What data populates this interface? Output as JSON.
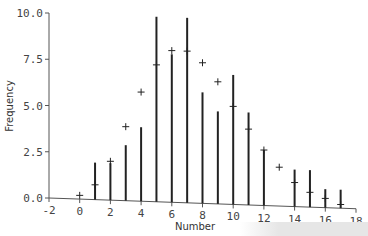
{
  "chart_data": {
    "type": "bar",
    "title": "",
    "xlabel": "Number",
    "ylabel": "Frequency",
    "xlim": [
      -2,
      18
    ],
    "ylim": [
      0,
      10
    ],
    "xticks": [
      -2,
      0,
      2,
      4,
      6,
      8,
      10,
      12,
      14,
      16,
      18
    ],
    "xtick_labels": [
      "-2",
      "0",
      "2",
      "4",
      "6",
      "8",
      "10",
      "12",
      "14",
      "16",
      "18"
    ],
    "yticks": [
      0,
      2.5,
      5,
      7.5,
      10
    ],
    "ytick_labels": [
      "0.0",
      "2.5",
      "5.0",
      "7.5",
      "10.0"
    ],
    "grid": false,
    "legend": null,
    "series": [
      {
        "name": "Observed frequency",
        "style": "vertical-lines",
        "x": [
          1,
          2,
          3,
          4,
          5,
          6,
          7,
          8,
          9,
          10,
          11,
          12,
          14,
          15,
          16,
          17
        ],
        "values": [
          2,
          2,
          3,
          4,
          10,
          8,
          10,
          6,
          5,
          7,
          5,
          3,
          2,
          2,
          1,
          1
        ]
      },
      {
        "name": "Expected frequency",
        "style": "plus-markers",
        "x": [
          0,
          1,
          2,
          3,
          4,
          5,
          6,
          7,
          8,
          9,
          10,
          11,
          12,
          13,
          14,
          15,
          16,
          17
        ],
        "values": [
          0.2,
          0.8,
          2.1,
          4.0,
          5.9,
          7.4,
          8.2,
          8.2,
          7.6,
          6.6,
          5.3,
          4.1,
          3.0,
          2.1,
          1.3,
          0.8,
          0.5,
          0.2
        ]
      }
    ]
  }
}
